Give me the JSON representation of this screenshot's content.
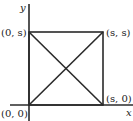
{
  "diagram": {
    "title": "",
    "axes": {
      "x_label": "x",
      "y_label": "y"
    },
    "points": [
      {
        "id": "origin",
        "label": "(0, 0)",
        "x": 0,
        "y": 0
      },
      {
        "id": "s0",
        "label": "(s, 0)",
        "x": "s",
        "y": 0
      },
      {
        "id": "ss",
        "label": "(s, s)",
        "x": "s",
        "y": "s"
      },
      {
        "id": "0s",
        "label": "(0, s)",
        "x": 0,
        "y": "s"
      }
    ],
    "shapes": [
      {
        "type": "square",
        "vertices": [
          "(0, 0)",
          "(s, 0)",
          "(s, s)",
          "(0, s)"
        ]
      },
      {
        "type": "diagonal",
        "from": "(0, 0)",
        "to": "(s, s)"
      },
      {
        "type": "diagonal",
        "from": "(0, s)",
        "to": "(s, 0)"
      }
    ],
    "colors": {
      "line": "#2a2a2a",
      "background": "#ffffff"
    }
  }
}
